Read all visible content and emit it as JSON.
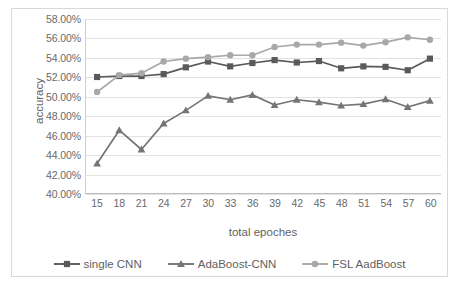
{
  "chart_data": {
    "type": "line",
    "title": "",
    "xlabel": "total epoches",
    "ylabel": "accuracy",
    "x": [
      15,
      18,
      21,
      24,
      27,
      30,
      33,
      36,
      39,
      42,
      45,
      48,
      51,
      54,
      57,
      60
    ],
    "xtick_labels": [
      "15",
      "18",
      "21",
      "24",
      "27",
      "30",
      "33",
      "36",
      "39",
      "42",
      "45",
      "48",
      "51",
      "54",
      "57",
      "60"
    ],
    "ylim": [
      40.0,
      58.0
    ],
    "ytick_labels": [
      "40.00%",
      "42.00%",
      "44.00%",
      "46.00%",
      "48.00%",
      "50.00%",
      "52.00%",
      "54.00%",
      "56.00%",
      "58.00%"
    ],
    "ytick_values": [
      40.0,
      42.0,
      44.0,
      46.0,
      48.0,
      50.0,
      52.0,
      54.0,
      56.0,
      58.0
    ],
    "grid": true,
    "legend_position": "bottom",
    "units": "percent",
    "series": [
      {
        "name": "single CNN",
        "marker": "square",
        "color": "#5a5a5a",
        "values": [
          52.0,
          52.1,
          52.1,
          52.3,
          53.0,
          53.6,
          53.1,
          53.45,
          53.75,
          53.5,
          53.65,
          52.9,
          53.1,
          53.05,
          52.7,
          53.9
        ]
      },
      {
        "name": "AdaBoost-CNN",
        "marker": "triangle",
        "color": "#757575",
        "values": [
          43.05,
          46.5,
          44.5,
          47.2,
          48.55,
          50.05,
          49.65,
          50.15,
          49.1,
          49.65,
          49.4,
          49.05,
          49.2,
          49.7,
          48.9,
          49.55
        ]
      },
      {
        "name": "FSL AadBoost",
        "marker": "circle",
        "color": "#a8a8a8",
        "values": [
          50.45,
          52.2,
          52.4,
          53.6,
          53.9,
          54.05,
          54.25,
          54.25,
          55.1,
          55.35,
          55.35,
          55.55,
          55.25,
          55.6,
          56.1,
          55.85
        ]
      }
    ]
  },
  "legend": {
    "items": [
      {
        "label": "single CNN"
      },
      {
        "label": "AdaBoost-CNN"
      },
      {
        "label": "FSL AadBoost"
      }
    ]
  },
  "colors": {
    "series_single_cnn": "#5a5a5a",
    "series_adaboost_cnn": "#757575",
    "series_fsl_aadboost": "#a8a8a8",
    "gridline": "#e2e2e2",
    "frame": "#d9d9d9",
    "axis_text": "#6a6a6a"
  }
}
